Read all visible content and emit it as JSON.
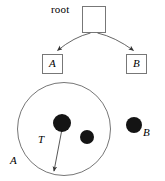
{
  "figure": {
    "name": "tree-and-region-diagram",
    "width": 165,
    "height": 181,
    "background": "#ffffff",
    "stroke_color": "#555555",
    "dot_color": "#111111",
    "text_color": "#000000"
  },
  "tree": {
    "root": {
      "label": "root",
      "box": {
        "x": 82,
        "y": 6,
        "w": 24,
        "h": 27
      }
    },
    "children": [
      {
        "label": "A",
        "box": {
          "x": 42,
          "y": 54,
          "w": 21,
          "h": 20
        },
        "edge": {
          "from_x": 91,
          "from_y": 33,
          "to_x": 55,
          "to_y": 52
        }
      },
      {
        "label": "B",
        "box": {
          "x": 126,
          "y": 54,
          "w": 21,
          "h": 20
        },
        "edge": {
          "from_x": 98,
          "from_y": 33,
          "to_x": 136,
          "to_y": 52
        }
      }
    ]
  },
  "region": {
    "circle": {
      "cx": 64,
      "cy": 129,
      "r": 47
    },
    "label": "A",
    "points_inside": [
      {
        "name": "point-large",
        "cx": 62,
        "cy": 123,
        "r": 9
      },
      {
        "name": "point-small",
        "cx": 87,
        "cy": 137,
        "r": 7
      }
    ],
    "vector": {
      "label": "T",
      "from_x": 62,
      "from_y": 129,
      "to_x": 54,
      "to_y": 172
    }
  },
  "outside": {
    "point": {
      "name": "point-b",
      "cx": 134,
      "cy": 125,
      "r": 8
    },
    "label": "B"
  }
}
